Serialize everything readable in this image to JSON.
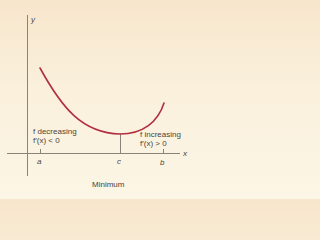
{
  "diagram": {
    "title": "Minimum",
    "axes": {
      "x_label": "x",
      "y_label": "y"
    },
    "points": {
      "a": "a",
      "b": "b",
      "c": "c"
    },
    "left_annotation": {
      "line1": "f decreasing",
      "line2": "f′(x) < 0"
    },
    "right_annotation": {
      "line1": "f increasing",
      "line2": "f′(x) > 0"
    },
    "colors": {
      "curve": "#b03040",
      "axis": "#8a8478",
      "text": "#4a4438"
    }
  }
}
